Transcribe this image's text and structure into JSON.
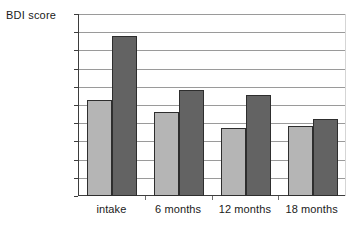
{
  "chart_data": {
    "type": "bar",
    "title": "",
    "subtitle": "",
    "xlabel": "",
    "ylabel": "BDI score",
    "categories": [
      "intake",
      "6 months",
      "12 months",
      "18 months"
    ],
    "series": [
      {
        "name": "series-1-light",
        "color": "#b5b5b5",
        "values": [
          15.3,
          14.6,
          13.75,
          13.85
        ]
      },
      {
        "name": "series-2-dark",
        "color": "#636363",
        "values": [
          18.8,
          15.8,
          15.55,
          14.25
        ]
      }
    ],
    "ylim": [
      10,
      20
    ],
    "y_ticks": [
      10,
      11,
      12,
      13,
      14,
      15,
      16,
      17,
      18,
      19,
      20
    ],
    "y_tick_labels": [
      "10",
      "11",
      "12",
      "13",
      "14",
      "15",
      "16",
      "17",
      "18",
      "19",
      "20"
    ],
    "grid": true,
    "grid_axis": "y",
    "legend": false,
    "legend_position": "none",
    "annotations": [],
    "axis_colors": {
      "axis_line": "#3d3d3d",
      "gridline": "#9a9a9a",
      "bar_outline": "#2e2e2e"
    }
  }
}
